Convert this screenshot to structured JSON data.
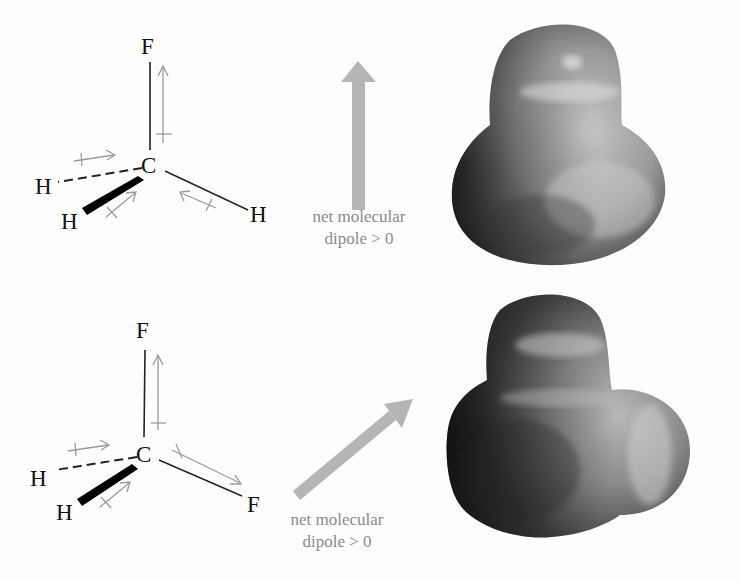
{
  "figure": {
    "panels": [
      {
        "molecule": "CH3F",
        "atoms": {
          "top": "F",
          "center": "C",
          "dash_left": "H",
          "wedge": "H",
          "right": "H"
        },
        "caption_line1": "net  molecular",
        "caption_line2": "dipole > 0",
        "net_dipole_direction": "up"
      },
      {
        "molecule": "CH2F2",
        "atoms": {
          "top": "F",
          "center": "C",
          "dash_left": "H",
          "wedge": "H",
          "right": "F"
        },
        "caption_line1": "net  molecular",
        "caption_line2": "dipole > 0",
        "net_dipole_direction": "up-right"
      }
    ],
    "colors": {
      "bond": "#222222",
      "bond_dipole_arrow": "#9a9a9a",
      "net_dipole_arrow": "#b5b5b5",
      "caption": "#8a8a8a",
      "surface_light": "#c9c9c9",
      "surface_dark": "#2a2a2a"
    }
  }
}
